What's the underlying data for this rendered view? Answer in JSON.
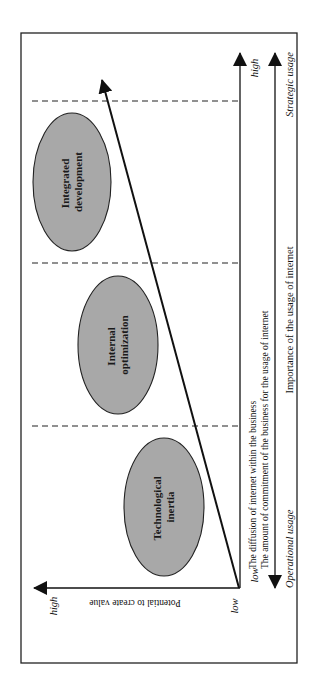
{
  "figure": {
    "border_color": "#222222",
    "ellipse_fill": "#a8a8a8",
    "stroke_color": "#111111",
    "stages": [
      {
        "line1": "Technological",
        "line2": "inertia"
      },
      {
        "line1": "Internal",
        "line2": "optimization"
      },
      {
        "line1": "Integrated",
        "line2": "development"
      }
    ],
    "y_axis": {
      "title": "Potential to create value",
      "low": "low",
      "high": "high"
    },
    "x_axis": {
      "low": "low",
      "high": "high",
      "label_line1": "The diffusion of internet within the business",
      "label_line2": "The amount of commitment of the business for the usage of internet"
    },
    "usage_axis": {
      "left": "Operational usage",
      "center": "Importance of the usage of internet",
      "right": "Strategic usage"
    }
  }
}
